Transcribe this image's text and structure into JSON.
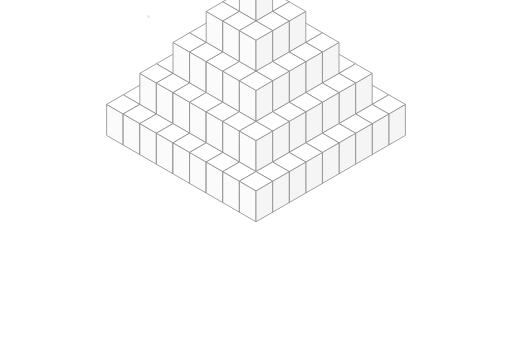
{
  "figure": {
    "background_color": "#ffffff",
    "line_color": "#8a8a8a",
    "line_color_dark": "#6e6e6e",
    "top_face_color": "#ffffff",
    "left_face_color": "#fbfbfb",
    "right_face_color": "#f5f5f5",
    "line_width": 0.8,
    "canvas": {
      "width": 510,
      "height": 359
    }
  },
  "geometry": {
    "type": "isometric-cube-stack",
    "grid_columns": 9,
    "grid_rows": 9,
    "cube_half_width": 16.6,
    "cube_half_depth": 9.6,
    "cube_height": 31.0,
    "origin_x": 256,
    "origin_y": 49,
    "max_stack_height": 5,
    "total_cubes": 165
  },
  "heightmap": {
    "description": "Stack height (number of cubes) at each grid cell [row][col]",
    "rows": [
      [
        1,
        1,
        1,
        1,
        1,
        1,
        1,
        1,
        1
      ],
      [
        1,
        2,
        2,
        2,
        2,
        2,
        2,
        2,
        1
      ],
      [
        1,
        2,
        3,
        3,
        3,
        3,
        3,
        2,
        1
      ],
      [
        1,
        2,
        3,
        4,
        4,
        4,
        3,
        2,
        1
      ],
      [
        1,
        2,
        3,
        4,
        5,
        4,
        3,
        2,
        1
      ],
      [
        1,
        2,
        3,
        4,
        4,
        4,
        3,
        2,
        1
      ],
      [
        1,
        2,
        3,
        3,
        3,
        3,
        3,
        2,
        1
      ],
      [
        1,
        2,
        2,
        2,
        2,
        2,
        2,
        2,
        1
      ],
      [
        1,
        1,
        1,
        1,
        1,
        1,
        1,
        1,
        1
      ]
    ]
  },
  "artifacts": [
    {
      "name": "scan-speck",
      "x": 147,
      "y": 15
    }
  ]
}
